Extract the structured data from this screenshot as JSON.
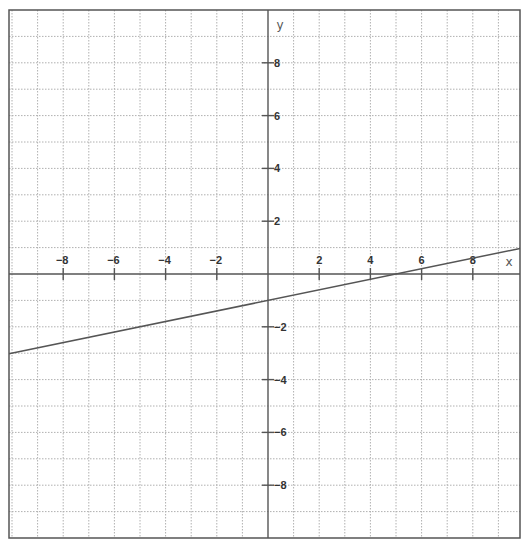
{
  "chart_data": {
    "type": "line",
    "title": "",
    "xlabel": "x",
    "ylabel": "y",
    "xlim": [
      -10,
      10
    ],
    "ylim": [
      -10,
      10
    ],
    "grid": true,
    "grid_step": 1,
    "x_ticks": [
      -8,
      -6,
      -4,
      -2,
      2,
      4,
      6,
      8
    ],
    "x_tick_labels": [
      "-8",
      "-6",
      "-4",
      "-2",
      "2",
      "4",
      "6",
      "8"
    ],
    "y_ticks": [
      8,
      6,
      4,
      2,
      -2,
      -4,
      -6,
      -8
    ],
    "y_tick_labels": [
      "8",
      "6",
      "4",
      "2",
      "-2",
      "-4",
      "-6",
      "-8"
    ],
    "series": [
      {
        "name": "y = 0.2x - 1",
        "equation": "y = 0.2x - 1",
        "slope": 0.2,
        "intercept": -1,
        "x": [
          -10,
          -5,
          0,
          5,
          10
        ],
        "y": [
          -3,
          -2,
          -1,
          0,
          1
        ],
        "color": "#555555"
      }
    ],
    "legend": null
  },
  "colors": {
    "frame": "#555555",
    "axis": "#555555",
    "grid": "#b0b0b0",
    "line": "#555555",
    "background": "#ffffff"
  }
}
